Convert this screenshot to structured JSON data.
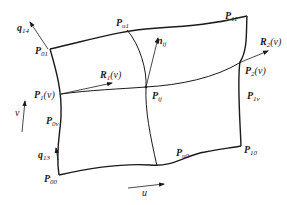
{
  "diagram": {
    "type": "parametric surface patch (Coons patch) with boundary curves",
    "points": {
      "P00": {
        "base": "P",
        "sub": "00"
      },
      "P01": {
        "base": "P",
        "sub": "01"
      },
      "P10": {
        "base": "P",
        "sub": "10"
      },
      "P11": {
        "base": "P",
        "sub": "11"
      },
      "Pu0": {
        "base": "P",
        "sub": "u0"
      },
      "Pu1": {
        "base": "P",
        "sub": "u1"
      },
      "P0v": {
        "base": "P",
        "sub": "0v"
      },
      "P1v": {
        "base": "P",
        "sub": "1v"
      },
      "Pij": {
        "base": "P",
        "sub": "ij"
      },
      "P1_v": {
        "base": "P",
        "sub": "1",
        "arg": "(v)"
      },
      "P2_v": {
        "base": "P",
        "sub": "2",
        "arg": "(v)"
      }
    },
    "vectors": {
      "nij": {
        "base": "n",
        "sub": "ij"
      },
      "R1_v": {
        "base": "R",
        "sub": "1",
        "arg": "(v)"
      },
      "R2_v": {
        "base": "R",
        "sub": "2",
        "arg": "(v)"
      },
      "q14": {
        "base": "q",
        "sub": "14"
      },
      "q13": {
        "base": "q",
        "sub": "13"
      }
    },
    "axes": {
      "u": "u",
      "v": "v"
    },
    "colors": {
      "stroke": "#1a1a1a",
      "background": "#ffffff"
    }
  }
}
